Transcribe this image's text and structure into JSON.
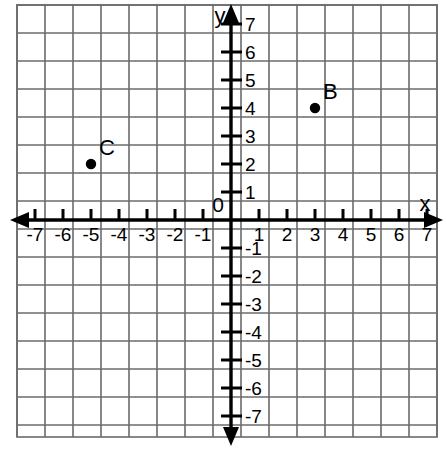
{
  "figure": {
    "type": "coordinate-plane",
    "background_color": "#ffffff",
    "grid_color": "#6b6b6b",
    "axis_color": "#000000",
    "point_color": "#000000",
    "x_axis_label": "x",
    "y_axis_label": "y",
    "origin_label": "0"
  },
  "chart_data": {
    "type": "scatter",
    "title": "",
    "xlabel": "x",
    "ylabel": "y",
    "xlim": [
      -7.5,
      7.5
    ],
    "ylim": [
      -7.5,
      7.5
    ],
    "grid": true,
    "legend": "none",
    "x_ticks": [
      -7,
      -6,
      -5,
      -4,
      -3,
      -2,
      -1,
      1,
      2,
      3,
      4,
      5,
      6,
      7
    ],
    "y_ticks": [
      7,
      6,
      5,
      4,
      3,
      2,
      1,
      -1,
      -2,
      -3,
      -4,
      -5,
      -6,
      -7
    ],
    "x_tick_labels": [
      "-7",
      "-6",
      "-5",
      "-4",
      "-3",
      "-2",
      "-1",
      "1",
      "2",
      "3",
      "4",
      "5",
      "6",
      "7"
    ],
    "y_tick_labels": [
      "7",
      "6",
      "5",
      "4",
      "3",
      "2",
      "1",
      "-1",
      "-2",
      "-3",
      "-4",
      "-5",
      "-6",
      "-7"
    ],
    "points": [
      {
        "label": "B",
        "x": 3,
        "y": 4
      },
      {
        "label": "C",
        "x": -5,
        "y": 2
      }
    ]
  },
  "labels": {
    "x_neg_7": "-7",
    "x_neg_6": "-6",
    "x_neg_5": "-5",
    "x_neg_4": "-4",
    "x_neg_3": "-3",
    "x_neg_2": "-2",
    "x_neg_1": "-1",
    "x_pos_1": "1",
    "x_pos_2": "2",
    "x_pos_3": "3",
    "x_pos_4": "4",
    "x_pos_5": "5",
    "x_pos_6": "6",
    "x_pos_7": "7",
    "y_pos_7": "7",
    "y_pos_6": "6",
    "y_pos_5": "5",
    "y_pos_4": "4",
    "y_pos_3": "3",
    "y_pos_2": "2",
    "y_pos_1": "1",
    "y_neg_1": "-1",
    "y_neg_2": "-2",
    "y_neg_3": "-3",
    "y_neg_4": "-4",
    "y_neg_5": "-5",
    "y_neg_6": "-6",
    "y_neg_7": "-7",
    "point_b": "B",
    "point_c": "C",
    "axis_x": "x",
    "axis_y": "y",
    "origin": "0"
  }
}
